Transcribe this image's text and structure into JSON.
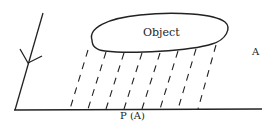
{
  "diagram": {
    "object_label": "Object",
    "plane_label": "A",
    "projection_label": "P (A)",
    "colors": {
      "stroke": "#222222",
      "background": "#ffffff"
    }
  }
}
